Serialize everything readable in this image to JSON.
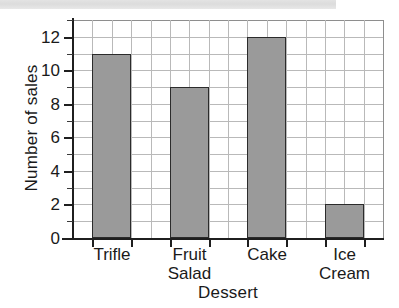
{
  "decor": {
    "top_band_name": "scan-artifact-band"
  },
  "chart_data": {
    "type": "bar",
    "title": "",
    "xlabel": "Dessert",
    "ylabel": "Number of sales",
    "categories": [
      "Trifle",
      "Fruit\nSalad",
      "Cake",
      "Ice\nCream"
    ],
    "values": [
      11,
      9,
      12,
      2
    ],
    "ylim": [
      0,
      13
    ],
    "ytick_labels": [
      "0",
      "2",
      "4",
      "6",
      "8",
      "10",
      "12"
    ],
    "ytick_values": [
      0,
      2,
      4,
      6,
      8,
      10,
      12
    ],
    "yminor_values": [
      1,
      3,
      5,
      7,
      9,
      11,
      13
    ],
    "grid": true,
    "grid_color": "#b9b9b9",
    "bar_color": "#9a9a9a",
    "bar_edge_color": "#2b2b2b",
    "legend": null,
    "vertical_grid_columns": 16
  }
}
